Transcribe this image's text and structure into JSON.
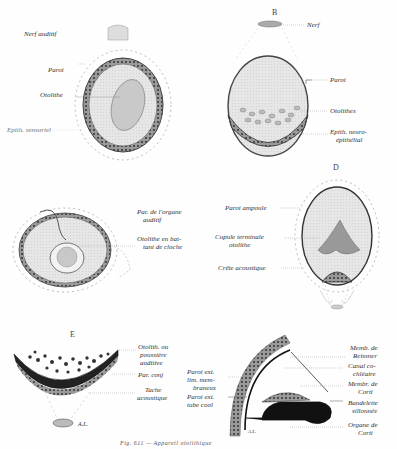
{
  "figure": {
    "caption": "Fig. 611 — Appareil otolithique",
    "panels": [
      {
        "id": "A",
        "letter": "",
        "labels": [
          "Nerf auditif",
          "Paroi",
          "Otolithe",
          "Epith. sensoriel"
        ]
      },
      {
        "id": "B",
        "letter": "B",
        "labels": [
          "Nerf",
          "Paroi",
          "Otolithes",
          "Epith. neuro-",
          "épithélial"
        ]
      },
      {
        "id": "C",
        "letter": "",
        "labels": [
          "Par. de l'organe",
          "auditif",
          "Otolithe en bat-",
          "tant de cloche"
        ]
      },
      {
        "id": "D",
        "letter": "D",
        "labels": [
          "Paroi ampoule",
          "Cupule terminale",
          "otolithe",
          "Crête acoustique"
        ]
      },
      {
        "id": "E",
        "letter": "E",
        "labels": [
          "Otolith. ou",
          "poussière",
          "auditive",
          "Par. conj",
          "Tache",
          "acoustique",
          "A.L."
        ]
      },
      {
        "id": "F",
        "letter": "",
        "labels": [
          "Paroi ext.",
          "lim. mem-",
          "braneux",
          "Paroi ext.",
          "tube cool",
          "Memb. de",
          "Reissner",
          "Canal co-",
          "chléaire",
          "Membr. de",
          "Corti",
          "Bandelette",
          "sillonnée",
          "Organe de",
          "Corti",
          "A.L."
        ]
      }
    ]
  }
}
